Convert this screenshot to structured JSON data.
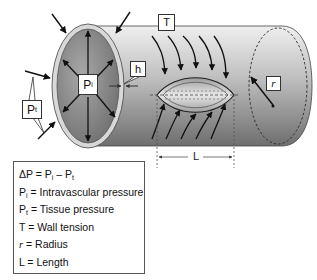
{
  "diagram": {
    "labels": {
      "T": "T",
      "h": "h",
      "Pi_main": "P",
      "Pi_sub": "i",
      "Pt_main": "P",
      "Pt_sub": "t",
      "r": "r",
      "L": "L"
    },
    "colors": {
      "tube_light": "#e6e6e6",
      "tube_dark": "#7a7a7a",
      "end_face": "#8c8c8c",
      "wall_ring": "#d9d9d9",
      "stroke": "#111111"
    }
  },
  "legend": {
    "rows": [
      {
        "main": "ΔP = P",
        "sub1": "i",
        "mid": " – P",
        "sub2": "t"
      },
      {
        "main": "P",
        "sub1": "i",
        "rest": " = Intravascular pressure"
      },
      {
        "main": "P",
        "sub1": "t",
        "rest": " = Tissue pressure"
      },
      {
        "main": "T",
        "rest": " = Wall tension"
      },
      {
        "main": "r",
        "rest": " = Radius"
      },
      {
        "main": "L",
        "rest": " = Length"
      }
    ]
  }
}
